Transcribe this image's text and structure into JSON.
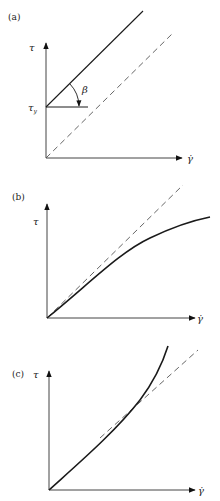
{
  "figure": {
    "panels": [
      {
        "id": "a",
        "label": "(a)",
        "y_axis_label": "τ",
        "x_axis_label": "γ̇",
        "yield_label": "τ",
        "yield_subscript": "y",
        "angle_label": "β",
        "description": "Bingham plastic: straight line with yield stress intercept, parallel dashed reference line through origin"
      },
      {
        "id": "b",
        "label": "(b)",
        "y_axis_label": "τ",
        "x_axis_label": "γ̇",
        "description": "Shear-thinning (pseudoplastic) curve falling below dashed Newtonian line"
      },
      {
        "id": "c",
        "label": "(c)",
        "y_axis_label": "τ",
        "x_axis_label": "γ̇",
        "description": "Shear-thickening (dilatant) curve rising above dashed Newtonian line"
      }
    ]
  },
  "colors": {
    "line": "#1a1a1a",
    "axis": "#333333",
    "dashed": "#555555",
    "background": "#ffffff"
  }
}
